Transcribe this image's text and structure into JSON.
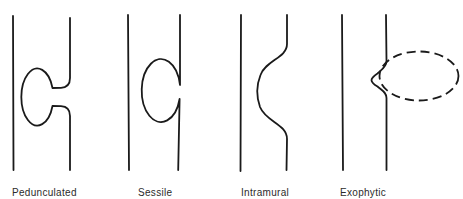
{
  "diagram": {
    "panels": [
      {
        "id": "pedunculated",
        "label": "Pedunculated"
      },
      {
        "id": "sessile",
        "label": "Sessile"
      },
      {
        "id": "intramural",
        "label": "Intramural"
      },
      {
        "id": "exophytic",
        "label": "Exophytic"
      }
    ]
  },
  "theme": {
    "stroke": "#1a1a1a",
    "text": "#2b2b2b",
    "background": "#ffffff"
  }
}
